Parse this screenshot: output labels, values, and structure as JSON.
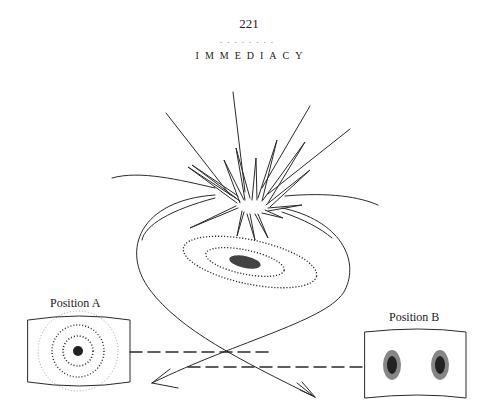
{
  "page": {
    "number": "221",
    "separator": "........",
    "running_head": "IMMEDIACY"
  },
  "figure": {
    "labels": {
      "position_a": "Position A",
      "position_b": "Position B"
    },
    "elements": [
      "starburst",
      "loop-curve",
      "spiral-galaxy",
      "screen-position-a-rings",
      "screen-position-b-two-clusters",
      "dashed-lines",
      "crossing-arrows"
    ],
    "ink_color": "#2a2a2a"
  }
}
